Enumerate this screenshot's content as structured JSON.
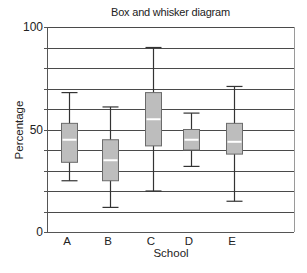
{
  "chart_data": {
    "type": "boxplot",
    "title": "Box and whisker diagram",
    "xlabel": "School",
    "ylabel": "Percentage",
    "ylim": [
      0,
      100
    ],
    "ytick_labels": [
      "0",
      "50",
      "100"
    ],
    "yticks": [
      0,
      50,
      100
    ],
    "grid": {
      "horizontal": true,
      "step": 10
    },
    "legend": null,
    "categories": [
      "A",
      "B",
      "C",
      "D",
      "E"
    ],
    "series": [
      {
        "name": "A",
        "min": 25,
        "q1": 34,
        "median": 45,
        "q3": 53,
        "max": 68
      },
      {
        "name": "B",
        "min": 12,
        "q1": 25,
        "median": 35,
        "q3": 45,
        "max": 61
      },
      {
        "name": "C",
        "min": 20,
        "q1": 42,
        "median": 55,
        "q3": 68,
        "max": 90
      },
      {
        "name": "D",
        "min": 32,
        "q1": 40,
        "median": 45,
        "q3": 50,
        "max": 58
      },
      {
        "name": "E",
        "min": 15,
        "q1": 38,
        "median": 44,
        "q3": 53,
        "max": 71
      }
    ],
    "colors": {
      "box_fill": "#bdbdbd",
      "box_stroke": "#6b6b6b",
      "median_line": "#ffffff",
      "whisker": "#333333",
      "grid": "#4a4a4a",
      "axis": "#555555"
    }
  }
}
